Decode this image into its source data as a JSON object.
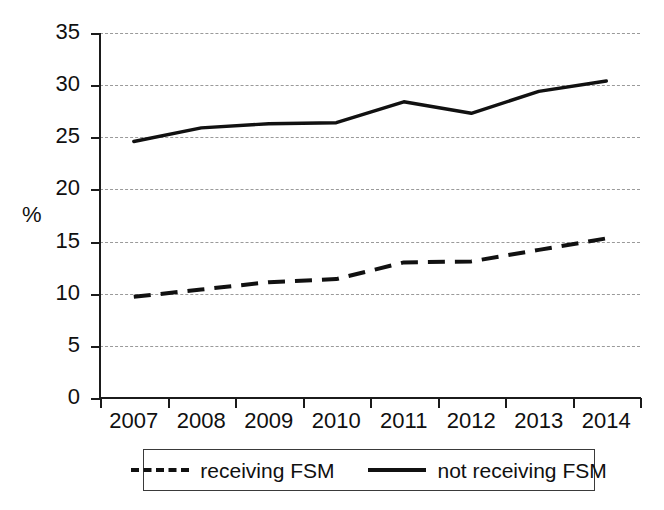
{
  "chart_data": {
    "type": "line",
    "title": "",
    "xlabel": "",
    "ylabel": "%",
    "categories": [
      "2007",
      "2008",
      "2009",
      "2010",
      "2011",
      "2012",
      "2013",
      "2014"
    ],
    "ylim": [
      0,
      35
    ],
    "yticks": [
      0,
      5,
      10,
      15,
      20,
      25,
      30,
      35
    ],
    "ytick_labels": [
      "0",
      "5",
      "10",
      "15",
      "20",
      "25",
      "30",
      "35"
    ],
    "grid": "horizontal-dotted",
    "legend_position": "below-plot",
    "series": [
      {
        "name": "receiving FSM",
        "style": "dashed",
        "color": "#111111",
        "values": [
          9.7,
          10.4,
          11.1,
          11.4,
          13.0,
          13.1,
          14.2,
          15.3
        ]
      },
      {
        "name": "not receiving FSM",
        "style": "solid",
        "color": "#111111",
        "values": [
          24.6,
          25.9,
          26.3,
          26.4,
          28.4,
          27.3,
          29.4,
          30.4
        ]
      }
    ]
  },
  "axis": {
    "y_title": "%"
  },
  "legend": {
    "entries": [
      {
        "label": "receiving FSM",
        "style": "dashed"
      },
      {
        "label": "not receiving FSM",
        "style": "solid"
      }
    ]
  }
}
